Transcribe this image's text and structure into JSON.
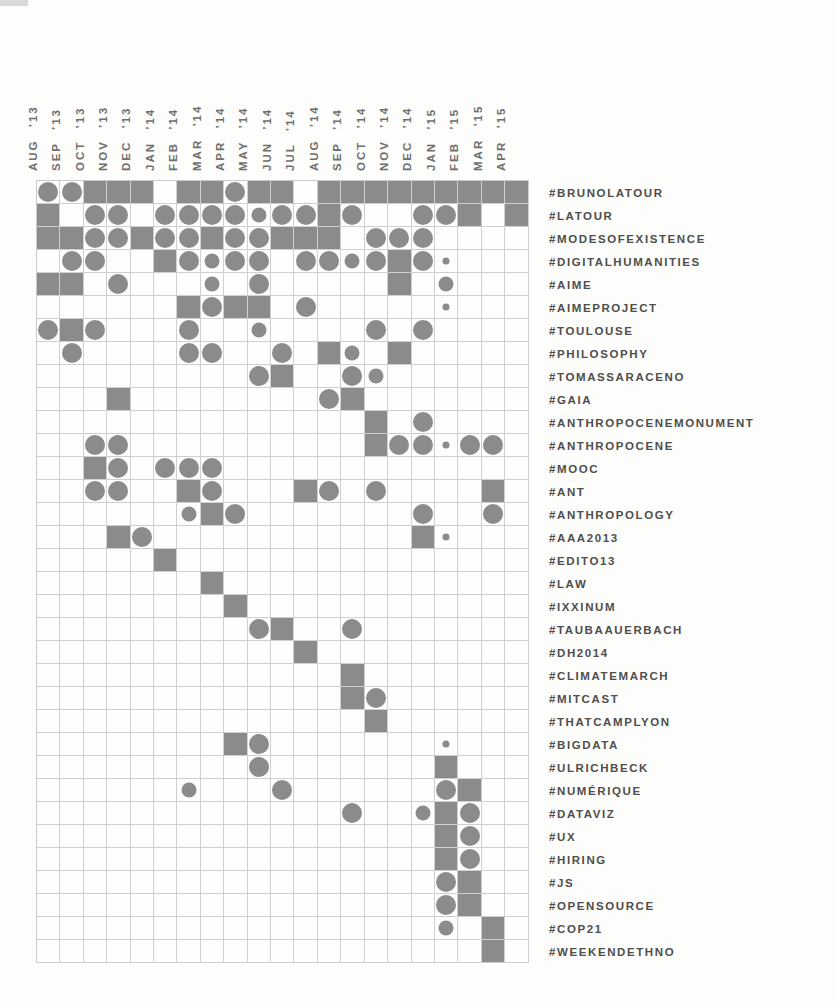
{
  "page": {
    "background_color": "#fdfdfc",
    "shape_color": "#8b8b8b",
    "grid_line_color": "#cfcfcd",
    "row_label_color": "#4e4e4c",
    "column_label_color": "#6e6e6c"
  },
  "chart_data": {
    "type": "heatmap",
    "title": "",
    "xlabel": "",
    "ylabel": "",
    "legend_position": "none",
    "grid": true,
    "cell_codes": {
      "": "empty cell",
      "sq": "filled square (highest intensity)",
      "lg": "large circle",
      "md": "medium circle",
      "dot": "small dot (lowest intensity)"
    },
    "columns": [
      "AUG ’13",
      "SEP ’13",
      "OCT ’13",
      "NOV ’13",
      "DEC ’13",
      "JAN ’14",
      "FEB ’14",
      "MAR ’14",
      "APR ’14",
      "MAY ’14",
      "JUN ’14",
      "JUL ’14",
      "AUG ’14",
      "SEP ’14",
      "OCT ’14",
      "NOV ’14",
      "DEC ’14",
      "JAN ’15",
      "FEB ’15",
      "MAR ’15",
      "APR ’15"
    ],
    "rows": [
      {
        "label": "#BRUNOLATOUR",
        "cells": [
          "lg",
          "lg",
          "sq",
          "sq",
          "sq",
          "",
          "sq",
          "sq",
          "lg",
          "sq",
          "sq",
          "",
          "sq",
          "sq",
          "sq",
          "sq",
          "sq",
          "sq",
          "sq",
          "sq",
          "sq"
        ]
      },
      {
        "label": "#LATOUR",
        "cells": [
          "sq",
          "",
          "lg",
          "lg",
          "",
          "lg",
          "lg",
          "lg",
          "lg",
          "md",
          "lg",
          "lg",
          "sq",
          "lg",
          "",
          "",
          "lg",
          "lg",
          "sq",
          "",
          "sq"
        ]
      },
      {
        "label": "#MODESOFEXISTENCE",
        "cells": [
          "sq",
          "sq",
          "lg",
          "lg",
          "sq",
          "lg",
          "lg",
          "sq",
          "lg",
          "lg",
          "sq",
          "sq",
          "sq",
          "",
          "lg",
          "lg",
          "lg",
          "",
          "",
          "",
          ""
        ]
      },
      {
        "label": "#DIGITALHUMANITIES",
        "cells": [
          "",
          "lg",
          "lg",
          "",
          "",
          "sq",
          "lg",
          "md",
          "lg",
          "lg",
          "",
          "lg",
          "lg",
          "md",
          "lg",
          "sq",
          "lg",
          "dot",
          "",
          "",
          ""
        ]
      },
      {
        "label": "#AIME",
        "cells": [
          "sq",
          "sq",
          "",
          "lg",
          "",
          "",
          "",
          "md",
          "",
          "lg",
          "",
          "",
          "",
          "",
          "",
          "sq",
          "",
          "md",
          "",
          "",
          ""
        ]
      },
      {
        "label": "#AIMEPROJECT",
        "cells": [
          "",
          "",
          "",
          "",
          "",
          "",
          "sq",
          "lg",
          "sq",
          "sq",
          "",
          "lg",
          "",
          "",
          "",
          "",
          "",
          "dot",
          "",
          "",
          ""
        ]
      },
      {
        "label": "#TOULOUSE",
        "cells": [
          "lg",
          "sq",
          "lg",
          "",
          "",
          "",
          "lg",
          "",
          "",
          "md",
          "",
          "",
          "",
          "",
          "lg",
          "",
          "lg",
          "",
          "",
          "",
          ""
        ]
      },
      {
        "label": "#PHILOSOPHY",
        "cells": [
          "",
          "lg",
          "",
          "",
          "",
          "",
          "lg",
          "lg",
          "",
          "",
          "lg",
          "",
          "sq",
          "md",
          "",
          "sq",
          "",
          "",
          "",
          "",
          ""
        ]
      },
      {
        "label": "#TOMASSARACENO",
        "cells": [
          "",
          "",
          "",
          "",
          "",
          "",
          "",
          "",
          "",
          "lg",
          "sq",
          "",
          "",
          "lg",
          "md",
          "",
          "",
          "",
          "",
          "",
          ""
        ]
      },
      {
        "label": "#GAIA",
        "cells": [
          "",
          "",
          "",
          "sq",
          "",
          "",
          "",
          "",
          "",
          "",
          "",
          "",
          "lg",
          "sq",
          "",
          "",
          "",
          "",
          "",
          "",
          ""
        ]
      },
      {
        "label": "#ANTHROPOCENEMONUMENT",
        "cells": [
          "",
          "",
          "",
          "",
          "",
          "",
          "",
          "",
          "",
          "",
          "",
          "",
          "",
          "",
          "sq",
          "",
          "lg",
          "",
          "",
          "",
          ""
        ]
      },
      {
        "label": "#ANTHROPOCENE",
        "cells": [
          "",
          "",
          "lg",
          "lg",
          "",
          "",
          "",
          "",
          "",
          "",
          "",
          "",
          "",
          "",
          "sq",
          "lg",
          "lg",
          "dot",
          "lg",
          "lg",
          ""
        ]
      },
      {
        "label": "#MOOC",
        "cells": [
          "",
          "",
          "sq",
          "lg",
          "",
          "lg",
          "lg",
          "lg",
          "",
          "",
          "",
          "",
          "",
          "",
          "",
          "",
          "",
          "",
          "",
          "",
          ""
        ]
      },
      {
        "label": "#ANT",
        "cells": [
          "",
          "",
          "lg",
          "lg",
          "",
          "",
          "sq",
          "lg",
          "",
          "",
          "",
          "sq",
          "lg",
          "",
          "lg",
          "",
          "",
          "",
          "",
          "sq",
          ""
        ]
      },
      {
        "label": "#ANTHROPOLOGY",
        "cells": [
          "",
          "",
          "",
          "",
          "",
          "",
          "md",
          "sq",
          "lg",
          "",
          "",
          "",
          "",
          "",
          "",
          "",
          "lg",
          "",
          "",
          "lg",
          ""
        ]
      },
      {
        "label": "#AAA2013",
        "cells": [
          "",
          "",
          "",
          "sq",
          "lg",
          "",
          "",
          "",
          "",
          "",
          "",
          "",
          "",
          "",
          "",
          "",
          "sq",
          "dot",
          "",
          "",
          ""
        ]
      },
      {
        "label": "#EDITO13",
        "cells": [
          "",
          "",
          "",
          "",
          "",
          "sq",
          "",
          "",
          "",
          "",
          "",
          "",
          "",
          "",
          "",
          "",
          "",
          "",
          "",
          "",
          ""
        ]
      },
      {
        "label": "#LAW",
        "cells": [
          "",
          "",
          "",
          "",
          "",
          "",
          "",
          "sq",
          "",
          "",
          "",
          "",
          "",
          "",
          "",
          "",
          "",
          "",
          "",
          "",
          ""
        ]
      },
      {
        "label": "#IXXINUM",
        "cells": [
          "",
          "",
          "",
          "",
          "",
          "",
          "",
          "",
          "sq",
          "",
          "",
          "",
          "",
          "",
          "",
          "",
          "",
          "",
          "",
          "",
          ""
        ]
      },
      {
        "label": "#TAUBAAUERBACH",
        "cells": [
          "",
          "",
          "",
          "",
          "",
          "",
          "",
          "",
          "",
          "lg",
          "sq",
          "",
          "",
          "lg",
          "",
          "",
          "",
          "",
          "",
          "",
          ""
        ]
      },
      {
        "label": "#DH2014",
        "cells": [
          "",
          "",
          "",
          "",
          "",
          "",
          "",
          "",
          "",
          "",
          "",
          "sq",
          "",
          "",
          "",
          "",
          "",
          "",
          "",
          "",
          ""
        ]
      },
      {
        "label": "#CLIMATEMARCH",
        "cells": [
          "",
          "",
          "",
          "",
          "",
          "",
          "",
          "",
          "",
          "",
          "",
          "",
          "",
          "sq",
          "",
          "",
          "",
          "",
          "",
          "",
          ""
        ]
      },
      {
        "label": "#MITCAST",
        "cells": [
          "",
          "",
          "",
          "",
          "",
          "",
          "",
          "",
          "",
          "",
          "",
          "",
          "",
          "sq",
          "lg",
          "",
          "",
          "",
          "",
          "",
          ""
        ]
      },
      {
        "label": "#THATCAMPLYON",
        "cells": [
          "",
          "",
          "",
          "",
          "",
          "",
          "",
          "",
          "",
          "",
          "",
          "",
          "",
          "",
          "sq",
          "",
          "",
          "",
          "",
          "",
          ""
        ]
      },
      {
        "label": "#BIGDATA",
        "cells": [
          "",
          "",
          "",
          "",
          "",
          "",
          "",
          "",
          "sq",
          "lg",
          "",
          "",
          "",
          "",
          "",
          "",
          "",
          "dot",
          "",
          "",
          ""
        ]
      },
      {
        "label": "#ULRICHBECK",
        "cells": [
          "",
          "",
          "",
          "",
          "",
          "",
          "",
          "",
          "",
          "lg",
          "",
          "",
          "",
          "",
          "",
          "",
          "",
          "sq",
          "",
          "",
          ""
        ]
      },
      {
        "label": "#NUMÉRIQUE",
        "cells": [
          "",
          "",
          "",
          "",
          "",
          "",
          "md",
          "",
          "",
          "",
          "lg",
          "",
          "",
          "",
          "",
          "",
          "",
          "lg",
          "sq",
          "",
          ""
        ]
      },
      {
        "label": "#DATAVIZ",
        "cells": [
          "",
          "",
          "",
          "",
          "",
          "",
          "",
          "",
          "",
          "",
          "",
          "",
          "",
          "lg",
          "",
          "",
          "md",
          "sq",
          "lg",
          "",
          ""
        ]
      },
      {
        "label": "#UX",
        "cells": [
          "",
          "",
          "",
          "",
          "",
          "",
          "",
          "",
          "",
          "",
          "",
          "",
          "",
          "",
          "",
          "",
          "",
          "sq",
          "lg",
          "",
          ""
        ]
      },
      {
        "label": "#HIRING",
        "cells": [
          "",
          "",
          "",
          "",
          "",
          "",
          "",
          "",
          "",
          "",
          "",
          "",
          "",
          "",
          "",
          "",
          "",
          "sq",
          "lg",
          "",
          ""
        ]
      },
      {
        "label": "#JS",
        "cells": [
          "",
          "",
          "",
          "",
          "",
          "",
          "",
          "",
          "",
          "",
          "",
          "",
          "",
          "",
          "",
          "",
          "",
          "lg",
          "sq",
          "",
          ""
        ]
      },
      {
        "label": "#OPENSOURCE",
        "cells": [
          "",
          "",
          "",
          "",
          "",
          "",
          "",
          "",
          "",
          "",
          "",
          "",
          "",
          "",
          "",
          "",
          "",
          "lg",
          "sq",
          "",
          ""
        ]
      },
      {
        "label": "#COP21",
        "cells": [
          "",
          "",
          "",
          "",
          "",
          "",
          "",
          "",
          "",
          "",
          "",
          "",
          "",
          "",
          "",
          "",
          "",
          "md",
          "",
          "sq",
          ""
        ]
      },
      {
        "label": "#WEEKENDETHNO",
        "cells": [
          "",
          "",
          "",
          "",
          "",
          "",
          "",
          "",
          "",
          "",
          "",
          "",
          "",
          "",
          "",
          "",
          "",
          "",
          "",
          "sq",
          ""
        ]
      }
    ]
  }
}
